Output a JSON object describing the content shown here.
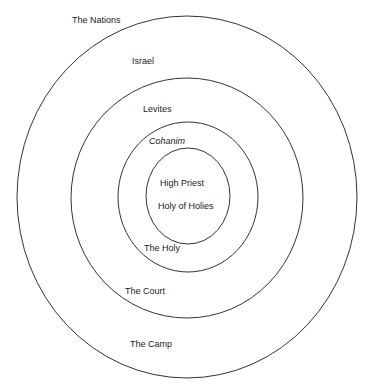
{
  "diagram": {
    "type": "concentric-circles",
    "rings": [
      {
        "name": "outer",
        "cx": 187,
        "cy": 197,
        "rx": 170,
        "ry": 181
      },
      {
        "name": "second",
        "cx": 187,
        "cy": 198,
        "rx": 116,
        "ry": 120
      },
      {
        "name": "third",
        "cx": 188,
        "cy": 197,
        "rx": 70,
        "ry": 75
      },
      {
        "name": "inner",
        "cx": 188,
        "cy": 196,
        "rx": 42,
        "ry": 48
      }
    ],
    "stroke_color": "#333333",
    "labels": {
      "nations": "The Nations",
      "israel": "Israel",
      "levites": "Levites",
      "cohanim": "Cohanim",
      "high_priest": "High Priest",
      "holy_of_holies": "Holy of Holies",
      "the_holy": "The Holy",
      "the_court": "The Court",
      "the_camp": "The Camp"
    }
  }
}
